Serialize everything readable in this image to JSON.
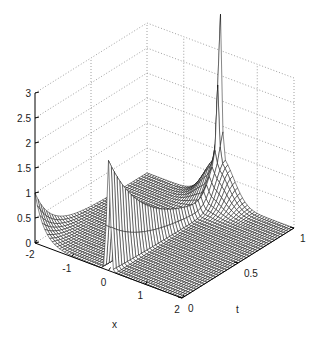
{
  "chart_data": {
    "type": "surface-mesh",
    "title": "",
    "xlabel": "x",
    "ylabel": "t",
    "zlabel": "",
    "x_ticks": [
      "-2",
      "-1",
      "0",
      "1",
      "2"
    ],
    "t_ticks": [
      "0",
      "0.5",
      "1"
    ],
    "z_ticks": [
      "0",
      "0.5",
      "1",
      "1.5",
      "2",
      "2.5",
      "3"
    ],
    "xlim": [
      -2,
      2
    ],
    "tlim": [
      0,
      1
    ],
    "zlim": [
      0,
      3
    ],
    "grid": true,
    "legend": null,
    "features": [
      {
        "name": "central-spike",
        "x": 0,
        "t": 0.1,
        "z": 2.2
      },
      {
        "name": "far-edge-peak",
        "x": 0,
        "t": 1.0,
        "z": 2.7
      },
      {
        "name": "left-edge-curves",
        "x": -2,
        "t": 0.0,
        "z_range": [
          0,
          1.0
        ]
      },
      {
        "name": "left-axis-spike",
        "x": -2,
        "t": 0.0,
        "z": 2.6
      }
    ],
    "view": {
      "azimuth": -37.5,
      "elevation": 30
    }
  },
  "colors": {
    "mesh": "#111111",
    "grid": "#888888",
    "axis": "#000000",
    "background": "#ffffff"
  }
}
